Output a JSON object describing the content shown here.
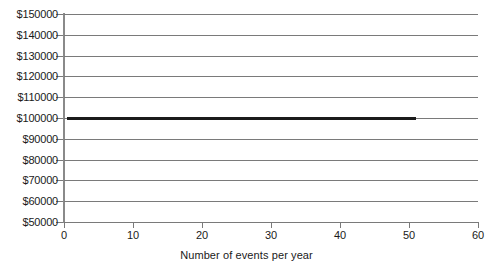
{
  "chart_data": {
    "type": "line",
    "title": "",
    "subtitle": "",
    "xlabel": "Number of events per year",
    "ylabel": "",
    "xlim": [
      0,
      60
    ],
    "ylim": [
      50000,
      150000
    ],
    "grid": true,
    "legend": "none",
    "xticks": [
      "0",
      "10",
      "20",
      "30",
      "40",
      "50",
      "60"
    ],
    "xtick_values": [
      0,
      10,
      20,
      30,
      40,
      50,
      60
    ],
    "yticks": [
      "$50000",
      "$60000",
      "$70000",
      "$80000",
      "$90000",
      "$100000",
      "$110000",
      "$120000",
      "$130000",
      "$140000",
      "$150000"
    ],
    "ytick_values": [
      50000,
      60000,
      70000,
      80000,
      90000,
      100000,
      110000,
      120000,
      130000,
      140000,
      150000
    ],
    "series": [
      {
        "name": "cost",
        "color": "#1b1b1b",
        "x": [
          0.4,
          51.0
        ],
        "values": [
          100000,
          100000
        ]
      }
    ],
    "colors": {
      "line": "#1b1b1b",
      "grid": "#7a7a7a",
      "axis": "#8a8a8a",
      "background": "#ffffff",
      "text": "#1a1a1a"
    }
  }
}
